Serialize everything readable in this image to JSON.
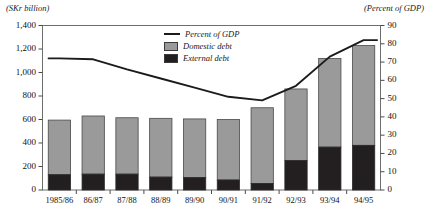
{
  "chart_data": {
    "type": "bar",
    "title": "",
    "left_axis_caption": "(SKr billion)",
    "right_axis_caption": "(Percent of GDP)",
    "xlabel": "",
    "ylabel": "SKr billion",
    "categories": [
      "1985/86",
      "86/87",
      "87/88",
      "88/89",
      "89/90",
      "90/91",
      "91/92",
      "92/93",
      "93/94",
      "94/95"
    ],
    "ylim": [
      0,
      1400
    ],
    "y_ticks": [
      "0",
      "200",
      "400",
      "600",
      "800",
      "1,000",
      "1,200",
      "1,400"
    ],
    "y_tick_values": [
      0,
      200,
      400,
      600,
      800,
      1000,
      1200,
      1400
    ],
    "ylim_right": [
      0,
      90
    ],
    "y_ticks_right": [
      "0",
      "10",
      "20",
      "30",
      "40",
      "50",
      "60",
      "70",
      "80",
      "90"
    ],
    "y_tick_values_right": [
      0,
      10,
      20,
      30,
      40,
      50,
      60,
      70,
      80,
      90
    ],
    "grid": false,
    "legend_position": "top-center",
    "series": [
      {
        "name": "External debt",
        "type": "bar",
        "color": "#231f20",
        "axis": "left",
        "values": [
          130,
          135,
          135,
          110,
          105,
          85,
          55,
          250,
          365,
          380
        ]
      },
      {
        "name": "Domestic debt",
        "type": "bar",
        "color": "#9a9a9a",
        "axis": "left",
        "values": [
          465,
          495,
          480,
          500,
          500,
          515,
          645,
          610,
          755,
          850
        ]
      },
      {
        "name": "Percent of GDP",
        "type": "line",
        "color": "#1b1b1b",
        "axis": "right",
        "values": [
          72,
          71.5,
          66,
          61,
          56,
          51,
          49,
          57,
          73,
          82
        ]
      }
    ],
    "totals": [
      595,
      630,
      615,
      610,
      605,
      600,
      700,
      860,
      1120,
      1230
    ]
  },
  "legend": {
    "items": [
      {
        "label": "Percent of GDP",
        "marker": "line"
      },
      {
        "label": "Domestic debt",
        "marker": "swatch-gray"
      },
      {
        "label": "External debt",
        "marker": "swatch-black"
      }
    ]
  }
}
